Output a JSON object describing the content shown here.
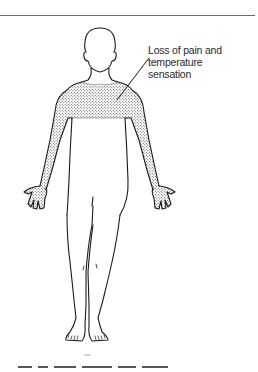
{
  "figure": {
    "type": "anatomical line drawing",
    "shaded_region": "shoulders, upper chest and both arms including hands (cape distribution)",
    "shading_style": "stipple",
    "annotation": {
      "lines": [
        "Loss of pain and",
        "temperature",
        "sensation"
      ]
    },
    "caption_visible": false
  },
  "colors": {
    "line": "#1a1a1a",
    "stipple": "#444444",
    "text": "#2a2a2a",
    "rule": "#6a6a6a",
    "background": "#ffffff"
  }
}
